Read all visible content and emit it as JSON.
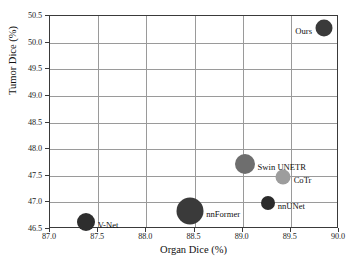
{
  "chart_data": {
    "type": "scatter",
    "title": "",
    "xlabel": "Organ Dice (%)",
    "ylabel": "Tumor Dice (%)",
    "xlim": [
      87.0,
      90.0
    ],
    "ylim": [
      46.5,
      50.5
    ],
    "xticks": [
      "87.0",
      "87.5",
      "88.0",
      "88.5",
      "89.0",
      "89.5",
      "90.0"
    ],
    "xtick_values": [
      87.0,
      87.5,
      88.0,
      88.5,
      89.0,
      89.5,
      90.0
    ],
    "yticks": [
      "46.5",
      "47.0",
      "47.5",
      "48.0",
      "48.5",
      "49.0",
      "49.5",
      "50.0",
      "50.5"
    ],
    "ytick_values": [
      46.5,
      47.0,
      47.5,
      48.0,
      48.5,
      49.0,
      49.5,
      50.0,
      50.5
    ],
    "grid": true,
    "legend": "none",
    "bubble_encoding": "marker area encodes model parameters / complexity",
    "points": [
      {
        "label": "V-Net",
        "x": 87.37,
        "y": 46.63,
        "radius_px": 9.0,
        "color": "#2e2e2e",
        "label_side": "right"
      },
      {
        "label": "nnFormer",
        "x": 88.45,
        "y": 46.83,
        "radius_px": 13.5,
        "color": "#3a3a3a",
        "label_side": "right"
      },
      {
        "label": "nnUNet",
        "x": 89.26,
        "y": 46.98,
        "radius_px": 7.0,
        "color": "#2b2b2b",
        "label_side": "right"
      },
      {
        "label": "CoTr",
        "x": 89.42,
        "y": 47.48,
        "radius_px": 7.5,
        "color": "#9d9d9d",
        "label_side": "right"
      },
      {
        "label": "Swin UNETR",
        "x": 89.02,
        "y": 47.73,
        "radius_px": 10.0,
        "color": "#6e6e6e",
        "label_side": "right"
      },
      {
        "label": "Ours",
        "x": 89.84,
        "y": 50.27,
        "radius_px": 8.5,
        "color": "#3a3a3a",
        "label_side": "left"
      }
    ]
  }
}
